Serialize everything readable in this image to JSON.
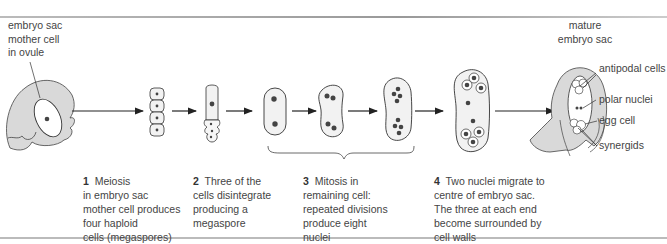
{
  "labels": {
    "mother_cell": [
      "embryo sac",
      "mother cell",
      "in  ovule"
    ],
    "mature": [
      "mature",
      "embryo sac"
    ],
    "antipodal": "antipodal cells",
    "polar": "polar nuclei",
    "egg": "egg cell",
    "synergids": "synergids"
  },
  "steps": [
    {
      "num": "1",
      "lines": [
        "Meiosis",
        "in embryo sac",
        "mother cell produces",
        "four haploid",
        "cells (megaspores)"
      ]
    },
    {
      "num": "2",
      "lines": [
        "Three of the",
        "cells disintegrate",
        "producing a",
        "megaspore"
      ]
    },
    {
      "num": "3",
      "lines": [
        "Mitosis in",
        "remaining cell:",
        "repeated divisions",
        "produce eight",
        "nuclei"
      ]
    },
    {
      "num": "4",
      "lines": [
        "Two nuclei migrate to",
        "centre of embryo sac.",
        "The three at each end",
        "become surrounded by",
        "cell walls"
      ]
    }
  ],
  "colors": {
    "tissue": "#d9d9d9",
    "cell_fill": "#f2f2f2",
    "nucleus": "#444444",
    "stroke": "#333333"
  }
}
